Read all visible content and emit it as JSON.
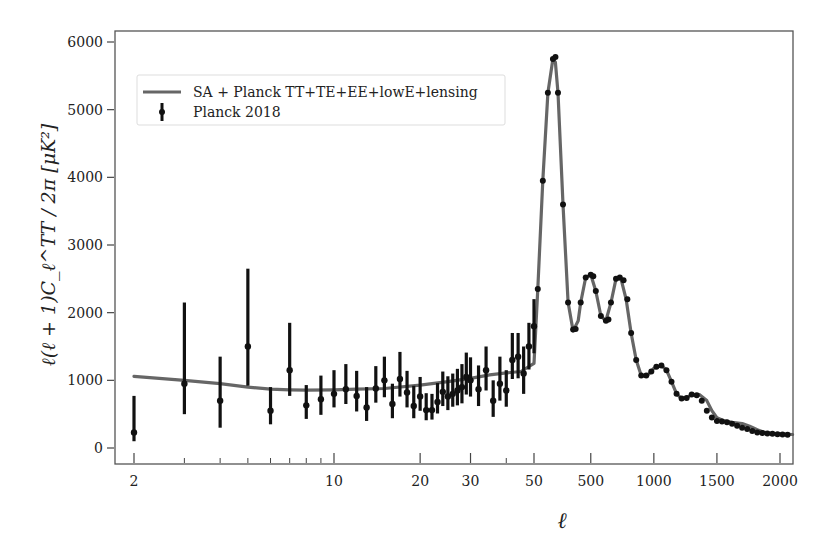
{
  "chart_data": {
    "type": "line",
    "title": "",
    "xlabel": "ℓ",
    "ylabel": "ℓ(ℓ + 1)C_ℓ^TT / 2π [μK²]",
    "x_scale": "hybrid: log for 2–50, linear for 50–2100",
    "xlim": [
      2,
      2100
    ],
    "ylim": [
      -200,
      6200
    ],
    "grid": false,
    "legend_position": "upper left",
    "x_ticks": [
      {
        "value": 2,
        "label": "2"
      },
      {
        "value": 10,
        "label": "10"
      },
      {
        "value": 20,
        "label": "20"
      },
      {
        "value": 30,
        "label": "30"
      },
      {
        "value": 50,
        "label": "50"
      },
      {
        "value": 500,
        "label": "500"
      },
      {
        "value": 1000,
        "label": "1000"
      },
      {
        "value": 1500,
        "label": "1500"
      },
      {
        "value": 2000,
        "label": "2000"
      }
    ],
    "x_minor_ticks": [
      3,
      4,
      5,
      6,
      7,
      8,
      9,
      40
    ],
    "y_ticks": [
      0,
      1000,
      2000,
      3000,
      4000,
      5000,
      6000
    ],
    "legend": [
      {
        "label": "SA + Planck TT+TE+EE+lowE+lensing",
        "kind": "line",
        "color": "#666666"
      },
      {
        "label": "Planck 2018",
        "kind": "errorbar",
        "color": "#111111"
      }
    ],
    "series": [
      {
        "name": "SA + Planck TT+TE+EE+lowE+lensing",
        "type": "line",
        "color": "#666666",
        "x": [
          2,
          3,
          4,
          5,
          6,
          7,
          8,
          10,
          12,
          15,
          20,
          25,
          30,
          35,
          40,
          45,
          50,
          80,
          120,
          160,
          200,
          220,
          240,
          280,
          320,
          360,
          400,
          420,
          460,
          500,
          540,
          580,
          620,
          660,
          700,
          740,
          780,
          820,
          860,
          900,
          940,
          980,
          1000,
          1060,
          1100,
          1140,
          1180,
          1220,
          1260,
          1300,
          1360,
          1420,
          1460,
          1500,
          1560,
          1620,
          1700,
          1760,
          1820,
          1880,
          1940,
          2000,
          2100
        ],
        "y": [
          1060,
          1000,
          950,
          900,
          870,
          860,
          855,
          860,
          870,
          880,
          930,
          980,
          1030,
          1080,
          1110,
          1130,
          1250,
          2350,
          3950,
          5250,
          5750,
          5700,
          5250,
          3600,
          2150,
          1730,
          1880,
          2150,
          2520,
          2560,
          2320,
          1950,
          1880,
          2150,
          2500,
          2500,
          2200,
          1700,
          1300,
          1070,
          1060,
          1130,
          1180,
          1220,
          1150,
          980,
          800,
          730,
          740,
          790,
          790,
          700,
          550,
          450,
          400,
          380,
          360,
          320,
          270,
          230,
          215,
          210,
          200
        ]
      },
      {
        "name": "Planck 2018",
        "type": "errorbar",
        "color": "#111111",
        "x": [
          2,
          3,
          4,
          5,
          6,
          7,
          8,
          9,
          10,
          11,
          12,
          13,
          14,
          15,
          16,
          17,
          18,
          19,
          20,
          21,
          22,
          23,
          24,
          25,
          26,
          27,
          28,
          29,
          30,
          32,
          34,
          36,
          38,
          40,
          42,
          44,
          46,
          48,
          50
        ],
        "y": [
          230,
          950,
          700,
          1500,
          550,
          1150,
          630,
          720,
          800,
          870,
          770,
          600,
          880,
          1000,
          650,
          1020,
          820,
          620,
          760,
          560,
          560,
          680,
          830,
          760,
          800,
          850,
          900,
          1050,
          1000,
          870,
          1150,
          700,
          950,
          850,
          1300,
          1350,
          1100,
          1500,
          1800
        ],
        "err_low": [
          130,
          450,
          400,
          580,
          200,
          380,
          200,
          230,
          200,
          220,
          230,
          200,
          210,
          250,
          210,
          260,
          220,
          180,
          210,
          150,
          140,
          170,
          210,
          200,
          190,
          220,
          240,
          260,
          240,
          250,
          300,
          240,
          250,
          240,
          280,
          320,
          300,
          340,
          400
        ],
        "err_high": [
          540,
          1200,
          650,
          1150,
          350,
          700,
          300,
          350,
          350,
          370,
          370,
          300,
          330,
          350,
          300,
          400,
          320,
          300,
          290,
          250,
          240,
          280,
          300,
          300,
          300,
          320,
          340,
          360,
          340,
          350,
          350,
          300,
          400,
          300,
          400,
          350,
          400,
          350,
          400
        ]
      },
      {
        "name": "Planck 2018 (binned, high-ℓ)",
        "type": "scatter",
        "color": "#111111",
        "x": [
          80,
          120,
          160,
          200,
          220,
          240,
          280,
          320,
          360,
          380,
          420,
          460,
          500,
          520,
          540,
          580,
          620,
          640,
          660,
          700,
          730,
          760,
          790,
          820,
          860,
          900,
          940,
          980,
          1020,
          1060,
          1100,
          1140,
          1180,
          1220,
          1260,
          1300,
          1340,
          1380,
          1420,
          1460,
          1500,
          1540,
          1580,
          1620,
          1660,
          1700,
          1740,
          1780,
          1820,
          1860,
          1900,
          1940,
          1980,
          2020,
          2060
        ],
        "y": [
          2350,
          3950,
          5250,
          5750,
          5780,
          5250,
          3600,
          2150,
          1750,
          1760,
          2150,
          2520,
          2560,
          2540,
          2320,
          1950,
          1880,
          1900,
          2150,
          2500,
          2520,
          2480,
          2200,
          1700,
          1300,
          1070,
          1070,
          1130,
          1200,
          1220,
          1150,
          980,
          800,
          730,
          740,
          790,
          780,
          700,
          550,
          450,
          400,
          390,
          380,
          360,
          330,
          300,
          280,
          250,
          230,
          220,
          215,
          210,
          205,
          200,
          195
        ]
      }
    ]
  },
  "axes": {
    "left_px": 115,
    "right_px": 793,
    "top_px": 31,
    "bottom_px": 464,
    "y0_px": 448,
    "y6000_px": 42,
    "x_px_map": {
      "2": 134,
      "10": 345,
      "20": 436,
      "30": 489,
      "50": 534,
      "500": 592,
      "1000": 654,
      "1500": 718,
      "2000": 780,
      "2100": 793
    }
  }
}
